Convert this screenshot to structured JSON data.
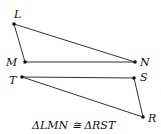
{
  "diagram": {
    "triangle1": {
      "name": "LMN",
      "points": {
        "L": {
          "label": "L",
          "x": 14,
          "y": 24
        },
        "M": {
          "label": "M",
          "x": 25,
          "y": 62
        },
        "N": {
          "label": "N",
          "x": 135,
          "y": 62
        }
      }
    },
    "triangle2": {
      "name": "RST",
      "points": {
        "T": {
          "label": "T",
          "x": 22,
          "y": 77
        },
        "S": {
          "label": "S",
          "x": 134,
          "y": 78
        },
        "R": {
          "label": "R",
          "x": 143,
          "y": 117
        }
      }
    },
    "caption": "ΔLMN ≅ ΔRST",
    "colors": {
      "line": "#333333",
      "point": "#111111",
      "text": "#111111"
    }
  }
}
